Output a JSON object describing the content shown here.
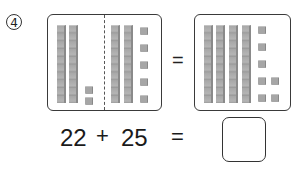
{
  "problem": {
    "number_label": "4",
    "left_box": {
      "left_group": {
        "tens": 2,
        "ones": 2
      },
      "right_group": {
        "tens": 2,
        "ones": 5
      }
    },
    "equals_symbol": "=",
    "right_box": {
      "tens": 4,
      "ones": 7
    },
    "equation": {
      "addend1": "22",
      "operator": "+",
      "addend2": "25",
      "equals": "=",
      "answer": ""
    }
  }
}
